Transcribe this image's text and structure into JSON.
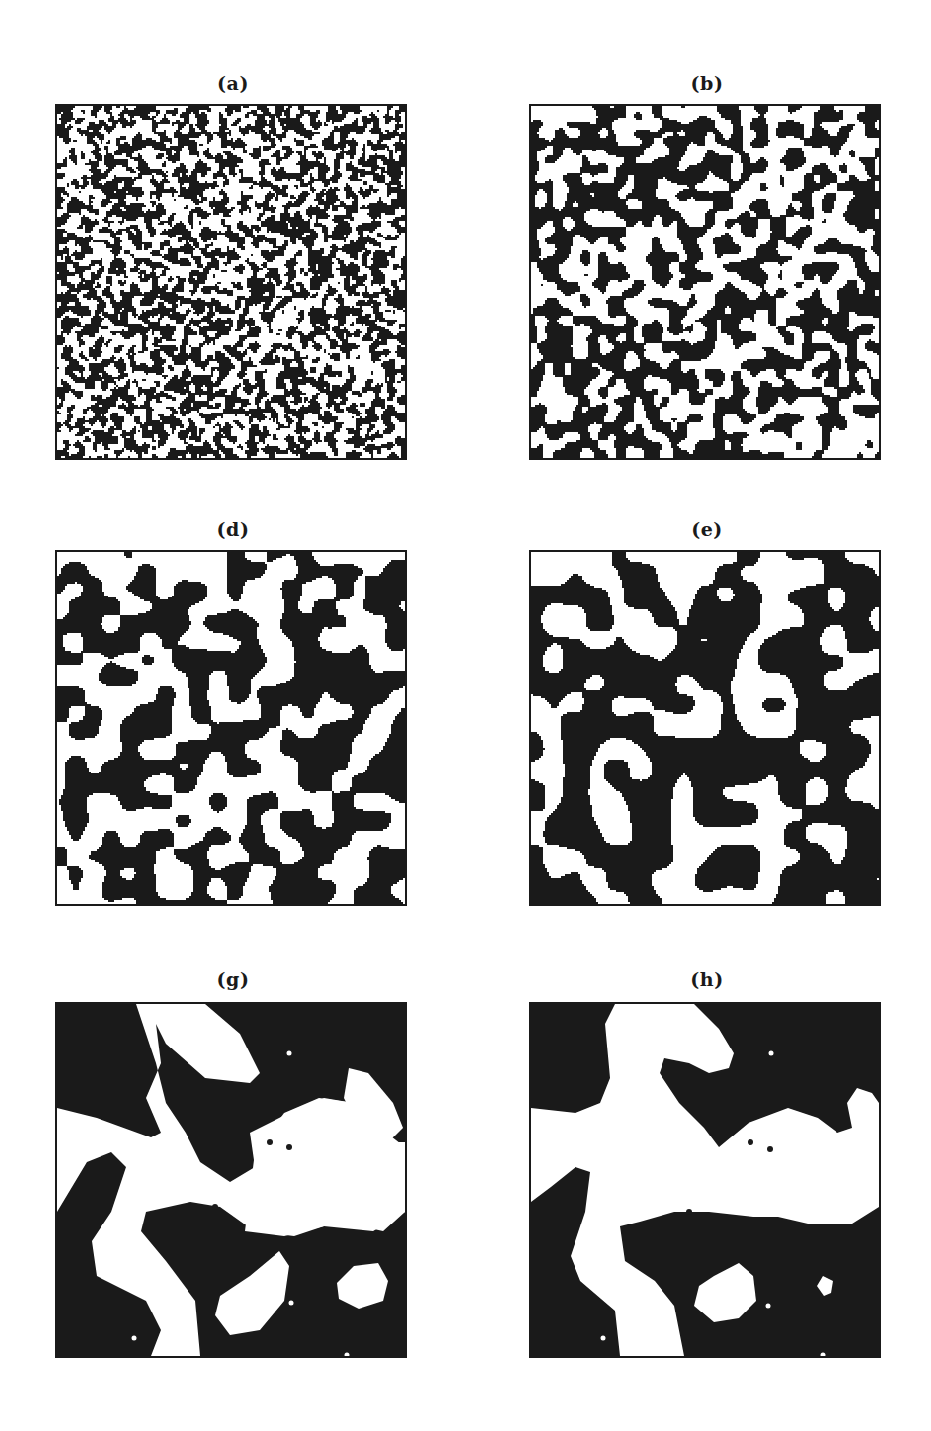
{
  "page": {
    "header_fragment": "",
    "background": "#ffffff",
    "ink_color": "#1a1a1a"
  },
  "figure": {
    "layout": {
      "rows": 3,
      "cols": 2
    },
    "panels": [
      {
        "id": "a",
        "label": "(a)",
        "left": 57,
        "top": 104,
        "label_top": 72,
        "grain": 1.4,
        "seed": 11,
        "smooth": 1,
        "fraction": 0.5
      },
      {
        "id": "b",
        "label": "(b)",
        "left": 531,
        "top": 104,
        "label_top": 72,
        "grain": 4.5,
        "seed": 23,
        "smooth": 2,
        "fraction": 0.5
      },
      {
        "id": "d",
        "label": "(d)",
        "left": 57,
        "top": 550,
        "label_top": 518,
        "grain": 9,
        "seed": 37,
        "smooth": 3,
        "fraction": 0.5
      },
      {
        "id": "e",
        "label": "(e)",
        "left": 531,
        "top": 550,
        "label_top": 518,
        "grain": 11,
        "seed": 37,
        "smooth": 4,
        "fraction": 0.55
      },
      {
        "id": "g",
        "label": "(g)",
        "left": 57,
        "top": 1002,
        "label_top": 968,
        "grain": 0,
        "seed": 0,
        "smooth": 0,
        "fraction": 0
      },
      {
        "id": "h",
        "label": "(h)",
        "left": 531,
        "top": 1002,
        "label_top": 968,
        "grain": 0,
        "seed": 0,
        "smooth": 0,
        "fraction": 0
      }
    ],
    "late_stage_shapes": {
      "g": {
        "white_blobs": [
          [
            [
              80,
              0
            ],
            [
              150,
              0
            ],
            [
              185,
              30
            ],
            [
              205,
              70
            ],
            [
              195,
              80
            ],
            [
              150,
              75
            ],
            [
              110,
              40
            ],
            [
              100,
              20
            ],
            [
              105,
              60
            ],
            [
              90,
              95
            ],
            [
              105,
              130
            ],
            [
              95,
              135
            ],
            [
              40,
              115
            ],
            [
              0,
              105
            ],
            [
              0,
              210
            ],
            [
              30,
              160
            ],
            [
              55,
              150
            ],
            [
              70,
              165
            ],
            [
              55,
              210
            ],
            [
              35,
              240
            ],
            [
              40,
              275
            ],
            [
              90,
              300
            ],
            [
              105,
              330
            ],
            [
              95,
              356
            ],
            [
              145,
              356
            ],
            [
              140,
              300
            ],
            [
              110,
              260
            ],
            [
              85,
              230
            ],
            [
              90,
              210
            ],
            [
              135,
              200
            ],
            [
              165,
              205
            ],
            [
              200,
              230
            ],
            [
              240,
              235
            ],
            [
              285,
              220
            ],
            [
              330,
              230
            ],
            [
              352,
              210
            ],
            [
              352,
              145
            ],
            [
              320,
              120
            ],
            [
              300,
              100
            ],
            [
              270,
              95
            ],
            [
              235,
              110
            ],
            [
              195,
              130
            ],
            [
              200,
              165
            ],
            [
              175,
              180
            ],
            [
              145,
              160
            ],
            [
              130,
              130
            ],
            [
              110,
              100
            ],
            [
              100,
              60
            ]
          ],
          [
            [
              200,
              150
            ],
            [
              230,
              110
            ],
            [
              265,
              95
            ],
            [
              300,
              100
            ],
            [
              340,
              140
            ],
            [
              352,
              140
            ],
            [
              352,
              210
            ],
            [
              320,
              230
            ],
            [
              270,
              225
            ],
            [
              230,
              235
            ],
            [
              190,
              230
            ]
          ],
          [
            [
              295,
              65
            ],
            [
              315,
              70
            ],
            [
              340,
              100
            ],
            [
              350,
              125
            ],
            [
              330,
              145
            ],
            [
              305,
              125
            ],
            [
              290,
              95
            ]
          ],
          [
            [
              195,
              275
            ],
            [
              225,
              250
            ],
            [
              235,
              265
            ],
            [
              230,
              300
            ],
            [
              205,
              330
            ],
            [
              175,
              335
            ],
            [
              160,
              315
            ],
            [
              165,
              295
            ]
          ],
          [
            [
              300,
              265
            ],
            [
              325,
              262
            ],
            [
              335,
              280
            ],
            [
              330,
              300
            ],
            [
              305,
              308
            ],
            [
              285,
              298
            ],
            [
              283,
              282
            ]
          ]
        ],
        "black_dots": [
          [
            215,
            140
          ],
          [
            235,
            145
          ],
          [
            160,
            205
          ]
        ],
        "white_dots": [
          [
            235,
            50
          ],
          [
            237,
            302
          ],
          [
            78,
            338
          ],
          [
            293,
            355
          ]
        ]
      },
      "h": {
        "white_blobs": [
          [
            [
              85,
              0
            ],
            [
              165,
              0
            ],
            [
              190,
              25
            ],
            [
              205,
              50
            ],
            [
              200,
              65
            ],
            [
              180,
              70
            ],
            [
              160,
              60
            ],
            [
              135,
              55
            ],
            [
              130,
              70
            ],
            [
              150,
              100
            ],
            [
              175,
              125
            ],
            [
              190,
              145
            ],
            [
              220,
              120
            ],
            [
              260,
              105
            ],
            [
              290,
              115
            ],
            [
              310,
              130
            ],
            [
              325,
              125
            ],
            [
              320,
              100
            ],
            [
              330,
              85
            ],
            [
              345,
              90
            ],
            [
              352,
              100
            ],
            [
              352,
              205
            ],
            [
              325,
              222
            ],
            [
              280,
              222
            ],
            [
              250,
              215
            ],
            [
              225,
              215
            ],
            [
              180,
              210
            ],
            [
              145,
              210
            ],
            [
              110,
              220
            ],
            [
              90,
              225
            ],
            [
              95,
              260
            ],
            [
              125,
              280
            ],
            [
              145,
              305
            ],
            [
              155,
              356
            ],
            [
              90,
              356
            ],
            [
              85,
              310
            ],
            [
              50,
              280
            ],
            [
              40,
              255
            ],
            [
              55,
              210
            ],
            [
              60,
              170
            ],
            [
              45,
              165
            ],
            [
              20,
              185
            ],
            [
              0,
              200
            ],
            [
              0,
              105
            ],
            [
              45,
              110
            ],
            [
              70,
              100
            ],
            [
              80,
              75
            ],
            [
              75,
              20
            ]
          ],
          [
            [
              185,
              275
            ],
            [
              210,
              262
            ],
            [
              225,
              275
            ],
            [
              228,
              300
            ],
            [
              210,
              318
            ],
            [
              185,
              322
            ],
            [
              165,
              305
            ],
            [
              170,
              285
            ]
          ],
          [
            [
              295,
              275
            ],
            [
              305,
              280
            ],
            [
              303,
              292
            ],
            [
              296,
              295
            ],
            [
              289,
              285
            ]
          ]
        ],
        "black_dots": [
          [
            222,
            140
          ],
          [
            242,
            147
          ],
          [
            160,
            210
          ]
        ],
        "white_dots": [
          [
            243,
            50
          ],
          [
            240,
            305
          ],
          [
            73,
            338
          ],
          [
            295,
            355
          ]
        ]
      }
    }
  }
}
